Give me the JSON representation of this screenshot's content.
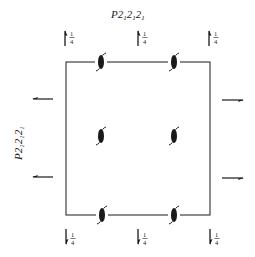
{
  "diagram": {
    "title": {
      "main": "P2",
      "parts": [
        "2",
        "2",
        "2"
      ],
      "subs": [
        "1",
        "1",
        "1"
      ]
    },
    "side_label": {
      "main": "P2",
      "parts": [
        "2",
        "2",
        "2"
      ],
      "subs": [
        "1",
        "1",
        "1"
      ]
    },
    "colors": {
      "ink": "#1a1a1a",
      "background": "#ffffff"
    },
    "cell": {
      "x1": 66,
      "y1": 62,
      "x2": 210,
      "y2": 215
    },
    "top_arrows": [
      {
        "x": 65,
        "label_num": "1",
        "label_den": "4",
        "direction": "up"
      },
      {
        "x": 138,
        "label_num": "1",
        "label_den": "4",
        "direction": "up"
      },
      {
        "x": 209,
        "label_num": "1",
        "label_den": "4",
        "direction": "up"
      }
    ],
    "bottom_arrows": [
      {
        "x": 66,
        "label_num": "1",
        "label_den": "4",
        "direction": "down"
      },
      {
        "x": 138,
        "label_num": "1",
        "label_den": "4",
        "direction": "down"
      },
      {
        "x": 210,
        "label_num": "1",
        "label_den": "4",
        "direction": "down"
      }
    ],
    "left_arrows": [
      {
        "y": 99,
        "direction": "left"
      },
      {
        "y": 177,
        "direction": "left"
      }
    ],
    "right_arrows": [
      {
        "y": 100,
        "direction": "right"
      },
      {
        "y": 178,
        "direction": "right"
      }
    ],
    "screw_axes": [
      {
        "x": 101,
        "y": 62
      },
      {
        "x": 174,
        "y": 62
      },
      {
        "x": 101,
        "y": 136
      },
      {
        "x": 174,
        "y": 136
      },
      {
        "x": 102,
        "y": 215
      },
      {
        "x": 174,
        "y": 215
      }
    ],
    "symbol_legend": "2₁ screw axis"
  }
}
